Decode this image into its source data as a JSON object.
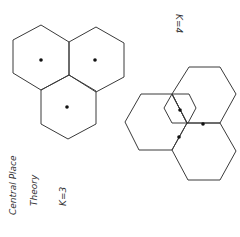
{
  "diagram": {
    "title_line1": "Central Place",
    "title_line2": "Theory",
    "k3_label": "K=3",
    "k4_label": "K=4",
    "stroke_color": "#3a3a3a",
    "dot_color": "#111111",
    "k3_hexagons": [
      {
        "name": "hexagon-top-left",
        "points": "41,25 69,42 69,75 41,90 13,73 13,40",
        "dot": [
          41,
          60
        ]
      },
      {
        "name": "hexagon-top-right",
        "points": "96,27 124,43 124,77 96,92 69,75 69,42",
        "dot": [
          95,
          60
        ]
      },
      {
        "name": "hexagon-bottom",
        "points": "69,75 96,91 96,124 68,139 41,124 41,90",
        "dot": [
          67,
          107
        ]
      }
    ],
    "k4_hexagons": [
      {
        "name": "hexagon-upper-right",
        "points": "189,67 220,67 236,94 220,123 187,123 172,94"
      },
      {
        "name": "hexagon-left",
        "points": "141,94 172,94 187,123 172,150 139,150 125,122"
      },
      {
        "name": "hexagon-lower-right",
        "points": "187,123 220,123 236,151 220,180 188,180 172,150"
      },
      {
        "name": "hexagon-small-center",
        "points": "172,94 189,94 196,108 188,123 172,123 164,108"
      }
    ],
    "k4_dots": [
      [
        180,
        110
      ],
      [
        203,
        124
      ],
      [
        179,
        137
      ]
    ]
  }
}
